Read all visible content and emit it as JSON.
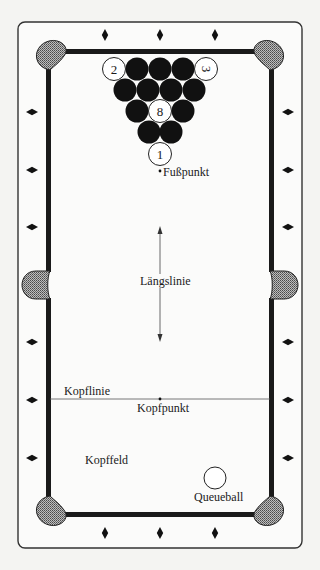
{
  "diagram": {
    "colors": {
      "background": "#f4f4f2",
      "frame_stroke": "#333333",
      "rail": "#1a1a1a",
      "pocket": "#8a8a8a",
      "ball_solid": "#111111",
      "ball_white": "#ffffff"
    },
    "labels": {
      "foot_spot": "Fußpunkt",
      "long_string": "Längslinie",
      "head_string": "Kopflinie",
      "head_spot": "Kopfpunkt",
      "kitchen": "Kopffeld",
      "cue_ball": "Queueball"
    },
    "rack": {
      "numbered_balls": [
        {
          "number": "2",
          "x": 114,
          "y": 69,
          "rotated": false
        },
        {
          "number": "3",
          "x": 206,
          "y": 69,
          "rotated": true
        },
        {
          "number": "8",
          "x": 160,
          "y": 111,
          "rotated": false
        },
        {
          "number": "1",
          "x": 160,
          "y": 154,
          "rotated": false
        }
      ],
      "solid_balls": [
        {
          "x": 137,
          "y": 69
        },
        {
          "x": 160,
          "y": 69
        },
        {
          "x": 183,
          "y": 69
        },
        {
          "x": 125,
          "y": 90
        },
        {
          "x": 148,
          "y": 90
        },
        {
          "x": 171,
          "y": 90
        },
        {
          "x": 194,
          "y": 90
        },
        {
          "x": 137,
          "y": 111
        },
        {
          "x": 183,
          "y": 111
        },
        {
          "x": 149,
          "y": 132
        },
        {
          "x": 171,
          "y": 132
        }
      ],
      "ball_radius": 11.5
    },
    "cue_ball": {
      "x": 215,
      "y": 478,
      "r": 11
    },
    "diamonds": {
      "top": [
        105,
        160,
        215
      ],
      "bottom": [
        105,
        160,
        215
      ],
      "left": [
        112,
        170,
        227,
        342,
        400,
        458
      ],
      "right": [
        112,
        170,
        227,
        342,
        400,
        458
      ]
    }
  }
}
